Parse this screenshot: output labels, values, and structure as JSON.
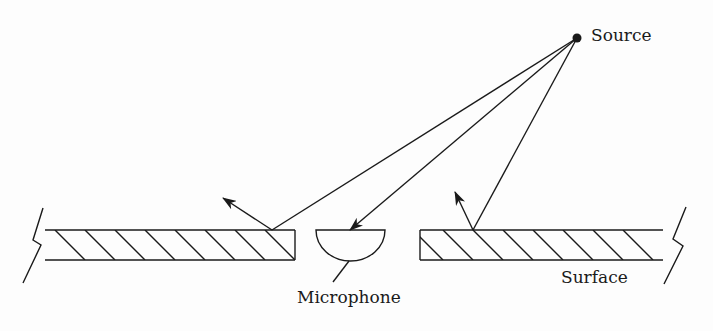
{
  "diagram": {
    "type": "acoustic reflection diagram",
    "labels": {
      "source": "Source",
      "microphone": "Microphone",
      "surface": "Surface"
    },
    "colors": {
      "line": "#1a1a1a",
      "background": "#fdfdfd"
    },
    "elements": [
      "point sound source",
      "direct ray from source to microphone",
      "ray reflecting off left surface segment",
      "ray reflecting off right surface segment",
      "semicircular microphone set in gap of hatched surface",
      "left hatched surface slab with break mark",
      "right hatched surface slab with break mark"
    ]
  }
}
